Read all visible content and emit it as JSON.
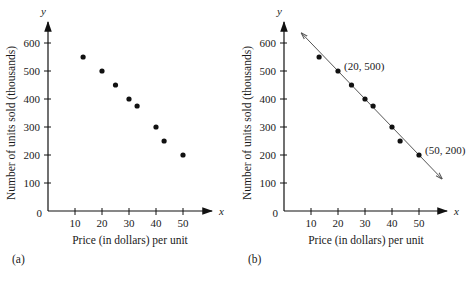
{
  "chart_data": [
    {
      "type": "scatter",
      "panel_label": "(a)",
      "title": "",
      "xlabel": "Price (in dollars) per unit",
      "ylabel": "Number of units sold (thousands)",
      "x_axis_var": "x",
      "y_axis_var": "y",
      "origin_label": "0",
      "x_ticks": [
        10,
        20,
        30,
        40,
        50
      ],
      "y_ticks": [
        100,
        200,
        300,
        400,
        500,
        600
      ],
      "xlim": [
        0,
        58
      ],
      "ylim": [
        0,
        660
      ],
      "grid": false,
      "points": [
        {
          "x": 13,
          "y": 550
        },
        {
          "x": 20,
          "y": 500
        },
        {
          "x": 25,
          "y": 450
        },
        {
          "x": 30,
          "y": 400
        },
        {
          "x": 33,
          "y": 375
        },
        {
          "x": 40,
          "y": 300
        },
        {
          "x": 43,
          "y": 250
        },
        {
          "x": 50,
          "y": 200
        }
      ]
    },
    {
      "type": "scatter",
      "panel_label": "(b)",
      "title": "",
      "xlabel": "Price (in dollars) per unit",
      "ylabel": "Number of units sold (thousands)",
      "x_axis_var": "x",
      "y_axis_var": "y",
      "origin_label": "0",
      "x_ticks": [
        10,
        20,
        30,
        40,
        50
      ],
      "y_ticks": [
        100,
        200,
        300,
        400,
        500,
        600
      ],
      "xlim": [
        0,
        58
      ],
      "ylim": [
        0,
        660
      ],
      "grid": false,
      "points": [
        {
          "x": 13,
          "y": 550
        },
        {
          "x": 20,
          "y": 500
        },
        {
          "x": 25,
          "y": 450
        },
        {
          "x": 30,
          "y": 400
        },
        {
          "x": 33,
          "y": 375
        },
        {
          "x": 40,
          "y": 300
        },
        {
          "x": 43,
          "y": 250
        },
        {
          "x": 50,
          "y": 200
        }
      ],
      "fit_line": {
        "through": [
          {
            "x": 20,
            "y": 500
          },
          {
            "x": 50,
            "y": 200
          }
        ],
        "slope": -10,
        "intercept": 700,
        "arrows_both_ends": true,
        "color": "#555555"
      },
      "annotations": [
        {
          "text": "(20, 500)",
          "x": 20,
          "y": 500
        },
        {
          "text": "(50, 200)",
          "x": 50,
          "y": 200
        }
      ]
    }
  ]
}
